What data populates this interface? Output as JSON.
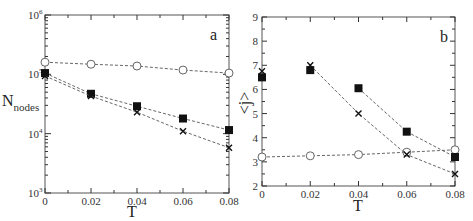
{
  "chart_data": [
    {
      "panel": "a",
      "type": "line",
      "title": "",
      "xlabel": "T",
      "ylabel": "N_nodes",
      "yscale": "log",
      "xlim": [
        0,
        0.08
      ],
      "ylim": [
        1000,
        1000000
      ],
      "x_ticks": [
        "0",
        "0.02",
        "0.04",
        "0.06",
        "0.08"
      ],
      "y_ticks": [
        "10^3",
        "10^4",
        "10^5",
        "10^6"
      ],
      "x": [
        0,
        0.02,
        0.04,
        0.06,
        0.08
      ],
      "grid": false,
      "series": [
        {
          "name": "circles",
          "marker": "open-circle",
          "values": [
            160000,
            148000,
            138000,
            118000,
            105000
          ]
        },
        {
          "name": "squares",
          "marker": "filled-square",
          "values": [
            105000,
            47000,
            29000,
            18000,
            11500
          ]
        },
        {
          "name": "crosses",
          "marker": "x",
          "values": [
            94000,
            43000,
            23000,
            11000,
            5800
          ]
        }
      ]
    },
    {
      "panel": "b",
      "type": "line",
      "title": "",
      "xlabel": "T",
      "ylabel": "<j>",
      "yscale": "linear",
      "xlim": [
        0,
        0.08
      ],
      "ylim": [
        2,
        9
      ],
      "x_ticks": [
        "0",
        "0.02",
        "0.04",
        "0.06",
        "0.08"
      ],
      "y_ticks": [
        "2",
        "3",
        "4",
        "5",
        "6",
        "7",
        "8",
        "9"
      ],
      "x": [
        0,
        0.02,
        0.04,
        0.06,
        0.08
      ],
      "grid": false,
      "series": [
        {
          "name": "circles",
          "marker": "open-circle",
          "values": [
            3.2,
            3.25,
            3.3,
            3.4,
            3.5
          ]
        },
        {
          "name": "squares",
          "marker": "filled-square",
          "values": [
            6.5,
            6.8,
            6.05,
            4.25,
            3.2
          ]
        },
        {
          "name": "crosses",
          "marker": "x",
          "values": [
            6.75,
            7.0,
            5.0,
            3.3,
            2.5
          ]
        }
      ]
    }
  ],
  "labels": {
    "panel_a": "a",
    "panel_b": "b",
    "a_xlabel": "T",
    "a_ylabel_main": "N",
    "a_ylabel_sub": "nodes",
    "b_xlabel": "T",
    "b_ylabel": "<j>",
    "x_ticks": [
      "0",
      "0.02",
      "0.04",
      "0.06",
      "0.08"
    ],
    "a_y_ticks": [
      {
        "base": "10",
        "exp": "3"
      },
      {
        "base": "10",
        "exp": "4"
      },
      {
        "base": "10",
        "exp": "5"
      },
      {
        "base": "10",
        "exp": "6"
      }
    ],
    "b_y_ticks": [
      "2",
      "3",
      "4",
      "5",
      "6",
      "7",
      "8",
      "9"
    ]
  }
}
